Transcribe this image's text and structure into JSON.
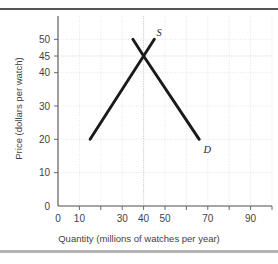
{
  "chart_data": {
    "type": "line",
    "title": "",
    "xlabel": "Quantity (millions of watches per year)",
    "ylabel": "Price (dollars per watch)",
    "xlim": [
      0,
      100
    ],
    "ylim": [
      0,
      57
    ],
    "grid": true,
    "legend_position": "inline-labels",
    "x_ticks": [
      0,
      10,
      20,
      30,
      40,
      50,
      60,
      70,
      80,
      90,
      100
    ],
    "x_tick_labels": [
      "0",
      "10",
      "",
      "30",
      "40",
      "50",
      "",
      "70",
      "",
      "90",
      ""
    ],
    "y_ticks": [
      0,
      10,
      20,
      30,
      40,
      45,
      50
    ],
    "y_tick_labels": [
      "0",
      "10",
      "20",
      "30",
      "40",
      "45",
      "50"
    ],
    "equilibrium": {
      "quantity": 40,
      "price": 45
    },
    "series": [
      {
        "name": "Supply",
        "label": "S",
        "label_point": {
          "x": 46,
          "y": 51
        },
        "points": [
          {
            "x": 15,
            "y": 20
          },
          {
            "x": 40,
            "y": 45
          },
          {
            "x": 45,
            "y": 50
          }
        ]
      },
      {
        "name": "Demand",
        "label": "D",
        "label_point": {
          "x": 68,
          "y": 16
        },
        "points": [
          {
            "x": 35,
            "y": 50
          },
          {
            "x": 40,
            "y": 45
          },
          {
            "x": 66,
            "y": 20
          }
        ]
      }
    ]
  },
  "annotations": {
    "supply_label": "S",
    "demand_label": "D"
  },
  "colors": {
    "curve": "#1a1a1a",
    "axis": "#4d4d4d",
    "grid": "#d8d8d8",
    "rule_top": "#555555",
    "rule_bottom": "#b4b4b4",
    "background": "#ffffff"
  }
}
